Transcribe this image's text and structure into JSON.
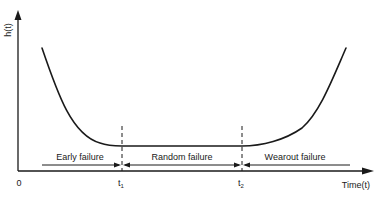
{
  "diagram": {
    "y_axis_label": "h(t)",
    "x_axis_label": "Time(t)",
    "origin_label": "0",
    "markers": [
      {
        "id": "t1",
        "base": "t",
        "sub": "1"
      },
      {
        "id": "t2",
        "base": "t",
        "sub": "2"
      }
    ],
    "regions": [
      {
        "id": "early",
        "label": "Early failure"
      },
      {
        "id": "random",
        "label": "Random failure"
      },
      {
        "id": "wearout",
        "label": "Wearout failure"
      }
    ],
    "colors": {
      "line": "#1a1a1a",
      "background": "#ffffff"
    }
  }
}
